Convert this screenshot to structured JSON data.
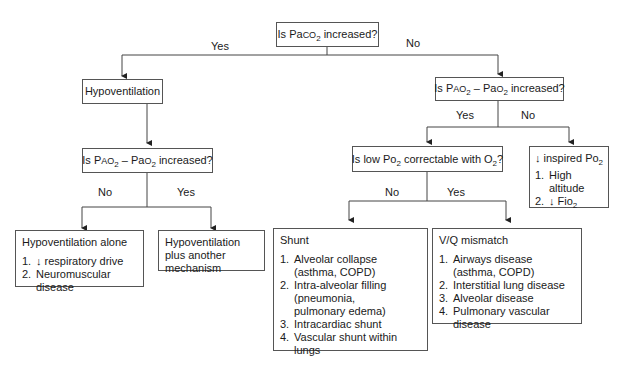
{
  "diagram": {
    "root": {
      "pre": "Is Pa",
      "sc": "CO",
      "sub": "2",
      "post": " increased?"
    },
    "edge_yes_1": "Yes",
    "edge_no_1": "No",
    "hypoventilation": "Hypoventilation",
    "q_gradient_left": {
      "pre": "Is P",
      "sc1": "AO",
      "sub1": "2",
      "mid": " – Pa",
      "sc2": "O",
      "sub2": "2",
      "post": " increased?"
    },
    "q_gradient_right": {
      "pre": "Is P",
      "sc1": "AO",
      "sub1": "2",
      "mid": " – Pa",
      "sc2": "O",
      "sub2": "2",
      "post": " increased?"
    },
    "edge_no_left": "No",
    "edge_yes_left": "Yes",
    "edge_yes_right": "Yes",
    "edge_no_right": "No",
    "q_correctable": {
      "pre": "Is low Po",
      "sub1": "2",
      "mid": " correctable with O",
      "sub2": "2",
      "post": "?"
    },
    "edge_no_correct": "No",
    "edge_yes_correct": "Yes",
    "hypo_alone": {
      "title": "Hypoventilation alone",
      "items": [
        {
          "num": "1.",
          "text": "↓ respiratory drive"
        },
        {
          "num": "2.",
          "text": "Neuromuscular disease"
        }
      ]
    },
    "hypo_plus": {
      "title": "Hypoventilation plus another mechanism"
    },
    "inspired": {
      "title_pre": "↓ inspired Po",
      "title_sub": "2",
      "items": [
        {
          "num": "1.",
          "text": "High altitude"
        },
        {
          "num": "2.",
          "text_pre": "↓ Fio",
          "text_sub": "2"
        }
      ]
    },
    "shunt": {
      "title": "Shunt",
      "items": [
        {
          "num": "1.",
          "text": "Alveolar collapse\n(asthma, COPD)"
        },
        {
          "num": "2.",
          "text": "Intra-alveolar filling\n(pneumonia,\npulmonary edema)"
        },
        {
          "num": "3.",
          "text": "Intracardiac shunt"
        },
        {
          "num": "4.",
          "text": "Vascular shunt within lungs"
        }
      ]
    },
    "vq": {
      "title": "V/Q mismatch",
      "items": [
        {
          "num": "1.",
          "text": "Airways disease\n(asthma, COPD)"
        },
        {
          "num": "2.",
          "text": "Interstitial lung disease"
        },
        {
          "num": "3.",
          "text": "Alveolar disease"
        },
        {
          "num": "4.",
          "text": "Pulmonary vascular disease"
        }
      ]
    }
  }
}
